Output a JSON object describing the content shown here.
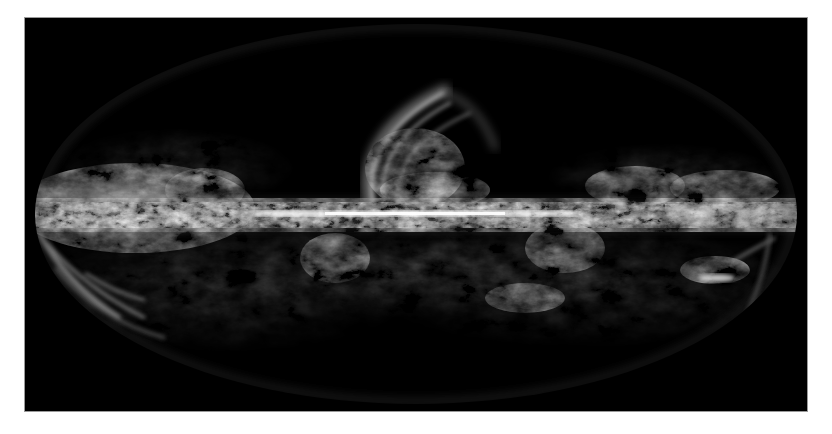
{
  "image": {
    "subject": "all-sky map of the Milky Way",
    "projection": "elliptical (Mollweide-style)",
    "description": "Grayscale all-sky emission map showing a bright horizontal galactic plane across the center of an ellipse, a large filamentary loop rising above the center, and wispy clouds above and below the plane on a black background.",
    "colors": {
      "page_background": "#ffffff",
      "frame_background": "#000000",
      "frame_edge": "#9a9a9a",
      "emission_bright": "#f2f2f2",
      "emission_mid": "#9a9a9a",
      "emission_faint": "#3a3a3a"
    },
    "features": [
      {
        "name": "galactic-plane",
        "label": "Galactic plane"
      },
      {
        "name": "central-loop",
        "label": "Large loop above galactic center"
      },
      {
        "name": "left-cloud-complex",
        "label": "Broad bright cloud complex, left side"
      },
      {
        "name": "lower-left-filaments",
        "label": "Filaments along lower-left limb"
      },
      {
        "name": "lower-right-cloud",
        "label": "Bright cloud below plane, right side"
      },
      {
        "name": "upper-right-wisps",
        "label": "Wisps above plane, right side"
      }
    ]
  }
}
